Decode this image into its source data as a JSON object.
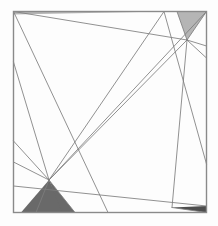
{
  "figure": {
    "canvas": {
      "width": 218,
      "height": 226
    },
    "colors": {
      "background": "#fdfdfd",
      "frame_stroke": "#8a8a8a",
      "line_stroke": "#7d7d7d",
      "shade_light": "#b5b5b5",
      "shade_dark": "#696969",
      "shade_darkest": "#4d4d4d"
    },
    "strokes": {
      "frame_width": 1.4,
      "line_width": 0.85
    },
    "frame": {
      "name": "square-border",
      "x1": 13.5,
      "y1": 11.5,
      "x2": 206.5,
      "y2": 212.5
    },
    "nodes": [
      {
        "name": "top-left-corner",
        "x": 13.5,
        "y": 11.5
      },
      {
        "name": "top-right-corner",
        "x": 206.5,
        "y": 11.5
      },
      {
        "name": "bottom-left-corner",
        "x": 13.5,
        "y": 212.5
      },
      {
        "name": "bottom-right-corner",
        "x": 206.5,
        "y": 212.5
      },
      {
        "name": "upper-right-hub",
        "x": 187.0,
        "y": 40.0
      },
      {
        "name": "lower-left-hub",
        "x": 49.0,
        "y": 180.0
      },
      {
        "name": "central-crossing",
        "x": 105.0,
        "y": 110.0
      }
    ],
    "lines": [
      {
        "name": "line-1",
        "x1": 13.5,
        "y1": 11.5,
        "x2": 187.0,
        "y2": 40.0
      },
      {
        "name": "line-2",
        "x1": 13.5,
        "y1": 11.5,
        "x2": 108.0,
        "y2": 212.5
      },
      {
        "name": "line-3",
        "x1": 13.5,
        "y1": 11.5,
        "x2": 164.0,
        "y2": 11.5
      },
      {
        "name": "line-4",
        "x1": 49.0,
        "y1": 180.0,
        "x2": 206.5,
        "y2": 11.5
      },
      {
        "name": "line-5",
        "x1": 49.0,
        "y1": 180.0,
        "x2": 164.0,
        "y2": 11.5
      },
      {
        "name": "line-6",
        "x1": 49.0,
        "y1": 180.0,
        "x2": 187.0,
        "y2": 40.0
      },
      {
        "name": "line-7",
        "x1": 49.0,
        "y1": 180.0,
        "x2": 13.5,
        "y2": 62.0
      },
      {
        "name": "line-8",
        "x1": 49.0,
        "y1": 180.0,
        "x2": 13.5,
        "y2": 141.0
      },
      {
        "name": "line-9",
        "x1": 49.0,
        "y1": 180.0,
        "x2": 13.5,
        "y2": 162.0
      },
      {
        "name": "line-10",
        "x1": 49.0,
        "y1": 180.0,
        "x2": 75.0,
        "y2": 212.5
      },
      {
        "name": "line-11",
        "x1": 49.0,
        "y1": 180.0,
        "x2": 36.0,
        "y2": 212.5
      },
      {
        "name": "line-12",
        "x1": 187.0,
        "y1": 40.0,
        "x2": 206.5,
        "y2": 11.5
      },
      {
        "name": "line-13",
        "x1": 187.0,
        "y1": 40.0,
        "x2": 206.5,
        "y2": 46.0
      },
      {
        "name": "line-14",
        "x1": 187.0,
        "y1": 40.0,
        "x2": 206.5,
        "y2": 58.0
      },
      {
        "name": "line-15",
        "x1": 187.0,
        "y1": 40.0,
        "x2": 177.0,
        "y2": 11.5
      },
      {
        "name": "line-16",
        "x1": 187.0,
        "y1": 40.0,
        "x2": 172.0,
        "y2": 207.5
      },
      {
        "name": "line-17",
        "x1": 13.5,
        "y1": 186.0,
        "x2": 206.5,
        "y2": 206.0
      },
      {
        "name": "line-18",
        "x1": 172.0,
        "y1": 207.5,
        "x2": 206.5,
        "y2": 212.5
      },
      {
        "name": "line-19",
        "x1": 164.0,
        "y1": 11.5,
        "x2": 206.5,
        "y2": 164.0
      }
    ],
    "shaded_regions": [
      {
        "name": "top-right-shaded-triangle",
        "tone": "light",
        "points": "177,11.5 206.5,11.5 187,40"
      },
      {
        "name": "top-left-shaded-sliver",
        "tone": "light",
        "points": "13.5,11.5 164,11.5 13.5,14.5"
      },
      {
        "name": "bottom-left-shaded-triangle",
        "tone": "dark",
        "points": "49,180 21,212.5 64,212.5"
      },
      {
        "name": "bottom-left-shaded-wedge",
        "tone": "dark",
        "points": "49,180 62,212.5 75,212.5"
      },
      {
        "name": "bottom-right-shaded-sliver",
        "tone": "darkest",
        "points": "172,207.5 206.5,206 206.5,212.5"
      }
    ]
  }
}
